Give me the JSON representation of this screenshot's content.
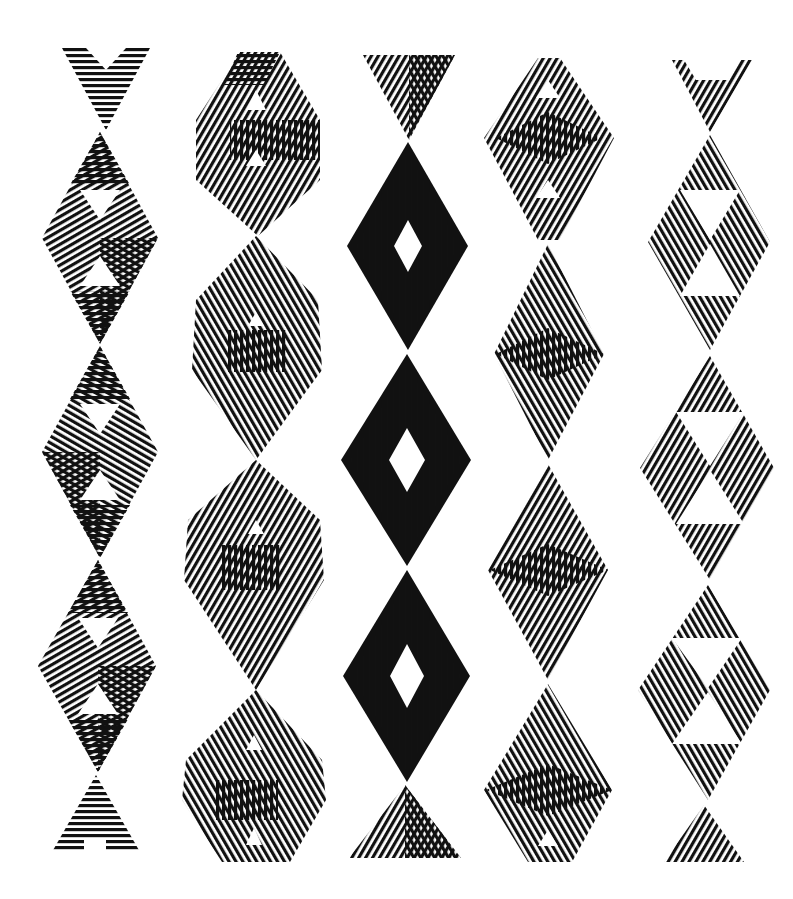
{
  "artwork": {
    "background": "#ffffff",
    "ink": "#111111",
    "columns": [
      {
        "name": "column-1-hexagram-triangles",
        "cx": 98,
        "top": 48,
        "bottom": 852,
        "halfWidth": 60,
        "style": "triangles"
      },
      {
        "name": "column-2-twisted-bands",
        "cx": 255,
        "top": 52,
        "bottom": 862,
        "halfWidth": 72,
        "style": "bands"
      },
      {
        "name": "column-3-concentric-diamonds",
        "cx": 407,
        "top": 55,
        "bottom": 860,
        "halfWidth": 66,
        "style": "concentric"
      },
      {
        "name": "column-4-crossed-lenses",
        "cx": 550,
        "top": 58,
        "bottom": 862,
        "halfWidth": 63,
        "style": "lenses"
      },
      {
        "name": "column-5-split-diamonds",
        "cx": 700,
        "top": 60,
        "bottom": 862,
        "halfWidth": 62,
        "style": "split"
      }
    ]
  }
}
